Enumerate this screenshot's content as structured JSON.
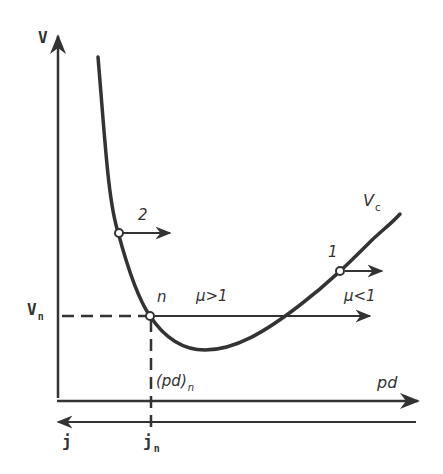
{
  "diagram": {
    "axes": {
      "y_label": "V",
      "x_label": "pd",
      "bottom_axis_label": "j",
      "bottom_axis_direction": "left"
    },
    "curve": {
      "name": "V",
      "name_sub": "c"
    },
    "markers": {
      "vn_label": "V",
      "vn_sub": "n",
      "pdn_label": "(pd)",
      "pdn_sub": "n",
      "jn_label": "j",
      "jn_sub": "n"
    },
    "points": [
      {
        "id": "n",
        "label": "n"
      },
      {
        "id": "1",
        "label": "1"
      },
      {
        "id": "2",
        "label": "2"
      }
    ],
    "regions": {
      "mu_gt_1": "μ>1",
      "mu_lt_1": "μ<1"
    },
    "colors": {
      "line": "#333333",
      "background": "#ffffff"
    }
  }
}
